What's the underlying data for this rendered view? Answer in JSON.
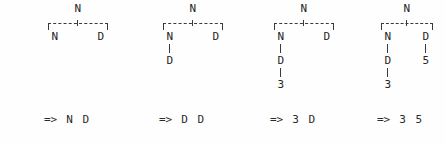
{
  "figure": {
    "background_color": "#fefefe",
    "ink_color": "#2b2b2b"
  },
  "columns": [
    {
      "id": "step-1",
      "left_px": 44,
      "width_px": 68,
      "root": "N",
      "left_spine": [
        "N"
      ],
      "right_spine": [
        "D"
      ],
      "result": {
        "arrow": "=>",
        "a": "N",
        "b": "D"
      }
    },
    {
      "id": "step-2",
      "left_px": 159,
      "width_px": 68,
      "root": "N",
      "left_spine": [
        "N",
        "D"
      ],
      "right_spine": [
        "D"
      ],
      "result": {
        "arrow": "=>",
        "a": "D",
        "b": "D"
      }
    },
    {
      "id": "step-3",
      "left_px": 270,
      "width_px": 68,
      "root": "N",
      "left_spine": [
        "N",
        "D",
        "3"
      ],
      "right_spine": [
        "D"
      ],
      "result": {
        "arrow": "=>",
        "a": "3",
        "b": "D"
      }
    },
    {
      "id": "step-4",
      "left_px": 377,
      "width_px": 60,
      "root": "N",
      "left_spine": [
        "N",
        "D",
        "3"
      ],
      "right_spine": [
        "D",
        "5"
      ],
      "result": {
        "arrow": "=>",
        "a": "3",
        "b": "5"
      }
    }
  ]
}
